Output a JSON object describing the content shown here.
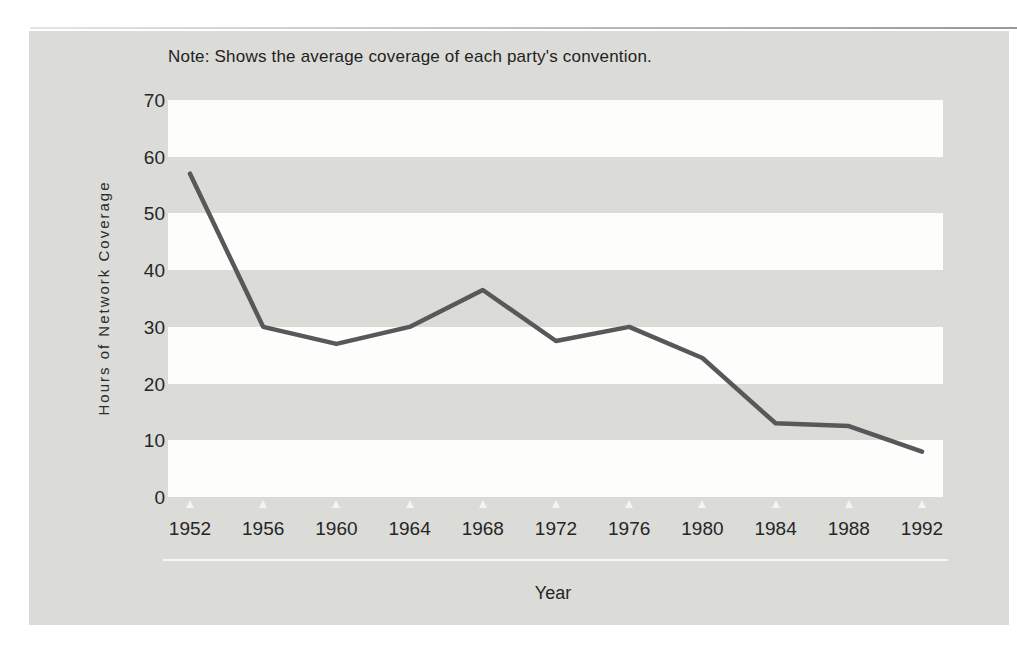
{
  "note": "Note: Shows the average coverage of each party's convention.",
  "chart_data": {
    "type": "line",
    "title": "",
    "xlabel": "Year",
    "ylabel": "Hours of Network Coverage",
    "categories": [
      "1952",
      "1956",
      "1960",
      "1964",
      "1968",
      "1972",
      "1976",
      "1980",
      "1984",
      "1988",
      "1992"
    ],
    "series": [
      {
        "name": "Average hours of network convention coverage",
        "values": [
          57,
          30,
          27,
          30,
          36.5,
          27.5,
          30,
          24.5,
          13,
          12.5,
          8
        ]
      }
    ],
    "y_ticks": [
      0,
      10,
      20,
      30,
      40,
      50,
      60,
      70
    ],
    "ylim": [
      0,
      70
    ],
    "grid": "alternating horizontal white bands (0-10, 20-30, 40-50, 60-70) on gray panel",
    "legend_position": "none"
  },
  "colors": {
    "panel_background": "#dbdbd8",
    "band_white": "#fdfdfb",
    "line": "#58585a",
    "text": "#262626",
    "tick_triangle": "#f4f4f1"
  }
}
